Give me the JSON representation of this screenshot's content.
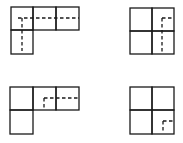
{
  "figure": {
    "stroke_color": "#1a1a1a",
    "background": "#ffffff",
    "panels": [
      {
        "id": "top-left",
        "shape": "L-shape: 3 squares top row, 1 square below left",
        "cells": [
          [
            11,
            7,
            22,
            23
          ],
          [
            33,
            7,
            23,
            23
          ],
          [
            56,
            7,
            23,
            23
          ],
          [
            11,
            30,
            22,
            24
          ]
        ],
        "dashed_lines": [
          [
            18,
            18,
            79,
            18
          ],
          [
            22,
            18,
            22,
            51
          ]
        ]
      },
      {
        "id": "top-right",
        "shape": "2x2 square grid",
        "cells": [
          [
            130,
            8,
            22,
            23
          ],
          [
            152,
            8,
            22,
            23
          ],
          [
            130,
            31,
            22,
            23
          ],
          [
            152,
            31,
            22,
            23
          ]
        ],
        "dashed_lines": [
          [
            162,
            18,
            174,
            18
          ],
          [
            162,
            18,
            162,
            52
          ]
        ]
      },
      {
        "id": "bottom-left",
        "shape": "L-shape: 3 squares top row, 1 square below left",
        "cells": [
          [
            10,
            87,
            23,
            23
          ],
          [
            33,
            87,
            23,
            23
          ],
          [
            56,
            87,
            23,
            23
          ],
          [
            10,
            110,
            23,
            24
          ]
        ],
        "dashed_lines": [
          [
            44,
            98,
            79,
            98
          ],
          [
            44,
            98,
            44,
            110
          ]
        ]
      },
      {
        "id": "bottom-right",
        "shape": "2x2 square grid",
        "cells": [
          [
            130,
            87,
            22,
            23
          ],
          [
            152,
            87,
            22,
            23
          ],
          [
            130,
            110,
            22,
            24
          ],
          [
            152,
            110,
            22,
            24
          ]
        ],
        "dashed_lines": [
          [
            163,
            121,
            174,
            121
          ],
          [
            163,
            121,
            163,
            132
          ]
        ]
      }
    ]
  }
}
